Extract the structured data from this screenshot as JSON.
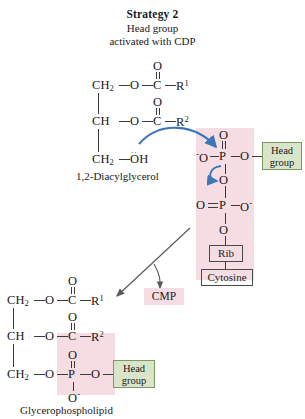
{
  "figure": {
    "title": "Strategy 2",
    "subtitle_line1": "Head group",
    "subtitle_line2": "activated with CDP"
  },
  "reactant": {
    "caption": "1,2-Diacylglycerol",
    "c1_label": "CH",
    "c1_sub": "2",
    "c1_o": "O",
    "c1_carbonyl_o": "O",
    "c1_c": "C",
    "c1_r": "R",
    "c1_r_sup": "1",
    "c2_label": "CH",
    "c2_o": "O",
    "c2_carbonyl_o": "O",
    "c2_c": "C",
    "c2_r": "R",
    "c2_r_sup": "2",
    "c3_label": "CH",
    "c3_sub": "2",
    "c3_oh": "OH",
    "lone_pair_dots": ".."
  },
  "cdp": {
    "top_oxygen": "O",
    "left_oxygen": "O",
    "left_oxygen_charge": "-",
    "phosphorus_1": "P",
    "bridge_oxygen_right": "O",
    "bridge_oxygen_middle": "O",
    "second_double_oxygen": "O",
    "phosphorus_2": "P",
    "second_right_oxygen": "O",
    "second_right_charge": "-",
    "bridge_oxygen_lower": "O",
    "ribose_label": "Rib",
    "cytosine_label": "Cytosine",
    "head_group_line1": "Head",
    "head_group_line2": "group"
  },
  "byproduct": {
    "label": "CMP"
  },
  "product": {
    "caption": "Glycerophospholipid",
    "c1_label": "CH",
    "c1_sub": "2",
    "c1_o": "O",
    "c1_carbonyl_o": "O",
    "c1_c": "C",
    "c1_r": "R",
    "c1_r_sup": "1",
    "c2_label": "CH",
    "c2_o": "O",
    "c2_carbonyl_o": "O",
    "c2_c": "C",
    "c2_r": "R",
    "c2_r_sup": "2",
    "c3_label": "CH",
    "c3_sub": "2",
    "c3_o": "O",
    "phosphate_top_o": "O",
    "phosphorus": "P",
    "phosphate_right_o": "O",
    "phosphate_bottom_o": "O",
    "phosphate_bottom_charge": "-",
    "head_group_line1": "Head",
    "head_group_line2": "group"
  },
  "colors": {
    "pink_highlight": "#f6dde3",
    "green_box_fill": "#d9e5c9",
    "green_box_border": "#7e9a62",
    "mechanism_arrow": "#3a76b8",
    "bond_stroke": "#3b3b3b",
    "reaction_arrow": "#5a5a5a"
  }
}
